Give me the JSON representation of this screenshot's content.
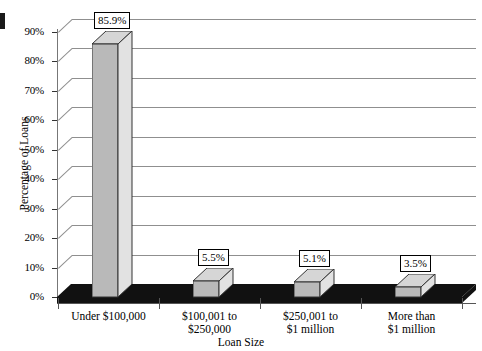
{
  "chart_data": {
    "type": "bar",
    "title": "",
    "xlabel": "Loan Size",
    "ylabel": "Percentage of Loans",
    "categories": [
      "Under $100,000",
      "$100,001 to\n$250,000",
      "$250,001 to\n$1 million",
      "More than\n$1 million"
    ],
    "category_lines": [
      [
        "Under $100,000"
      ],
      [
        "$100,001 to",
        "$250,000"
      ],
      [
        "$250,001 to",
        "$1 million"
      ],
      [
        "More than",
        "$1 million"
      ]
    ],
    "values": [
      85.9,
      5.5,
      5.1,
      3.5
    ],
    "value_labels": [
      "85.9%",
      "5.5%",
      "5.1%",
      "3.5%"
    ],
    "ylim": [
      0,
      90
    ],
    "ytick_values": [
      90,
      80,
      70,
      60,
      50,
      40,
      30,
      20,
      10,
      0
    ],
    "ytick_labels": [
      "90%",
      "80%",
      "70%",
      "60%",
      "50%",
      "40%",
      "30%",
      "20%",
      "10%",
      "0%"
    ],
    "grid": true,
    "legend": false,
    "style": "3d-column"
  },
  "colors": {
    "bar_front": "#b9b9b9",
    "bar_top": "#d6d6d6",
    "bar_side": "#e2e2e2",
    "bar_outline": "#333333",
    "gridline": "#8f8f8f",
    "floor": "#111111",
    "background": "#ffffff",
    "text": "#000000"
  }
}
